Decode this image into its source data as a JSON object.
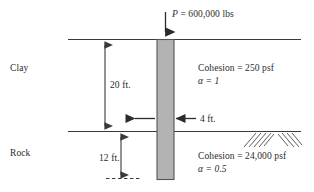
{
  "figure": {
    "type": "geotechnical-cross-section",
    "background_color": "#ffffff",
    "line_color": "#3a3a3a",
    "shaft_fill_color": "#b3b3b3",
    "shaft_edge_color": "#555555",
    "text_color": "#2b2b2b"
  },
  "load": {
    "symbol": "P",
    "equals": " = ",
    "value": "600,000",
    "unit": "lbs",
    "full_label": "P = 600,000 lbs",
    "arrow_direction": "down"
  },
  "layers": [
    {
      "name": "Clay",
      "label": "Clay",
      "cohesion_label": "Cohesion  = 250 psf",
      "cohesion_value": "250",
      "cohesion_unit": "psf",
      "alpha_label": "α = 1",
      "alpha_value": "1",
      "thickness_label": "20 ft.",
      "thickness_value": "20",
      "thickness_unit": "ft."
    },
    {
      "name": "Rock",
      "label": "Rock",
      "cohesion_label": "Cohesion = 24,000 psf",
      "cohesion_value": "24,000",
      "cohesion_unit": "psf",
      "alpha_label": "α = 0.5",
      "alpha_value": "0.5",
      "thickness_label": "12 ft.",
      "thickness_value": "12",
      "thickness_unit": "ft."
    }
  ],
  "shaft": {
    "diameter_label": "4 ft.",
    "diameter_value": "4",
    "diameter_unit": "ft.",
    "arrow_direction": "inward-pair"
  },
  "dimensions": {
    "clay_depth": "20 ft.",
    "rock_socket_depth": "12 ft.",
    "shaft_diameter": "4 ft."
  },
  "annotations": {
    "ground_line": "ground-surface",
    "rock_line": "top-of-rock",
    "base_line": "shaft-base-dashed",
    "hatching": "rock-hatch-chevron"
  }
}
